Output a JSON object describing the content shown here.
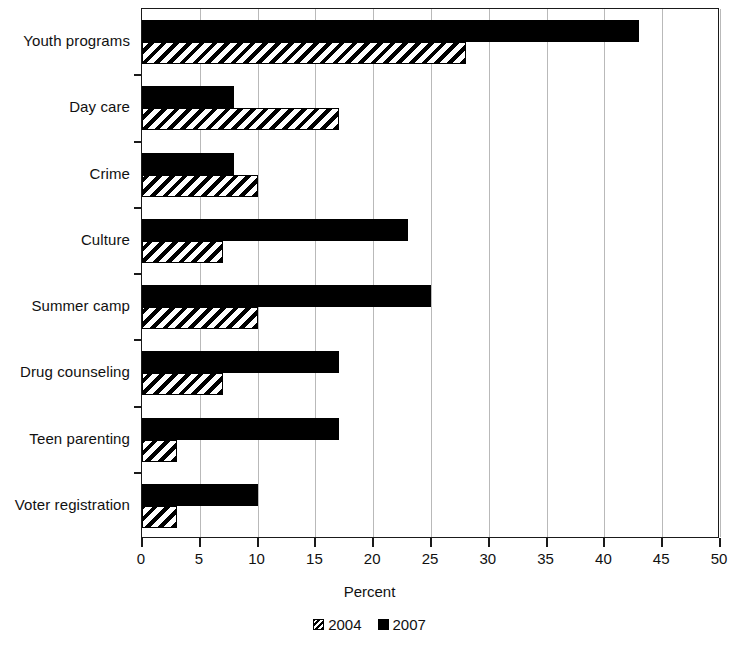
{
  "chart_data": {
    "type": "bar",
    "orientation": "horizontal",
    "title": "",
    "xlabel": "Percent",
    "ylabel": "",
    "xlim": [
      0,
      50
    ],
    "xticks": [
      0,
      5,
      10,
      15,
      20,
      25,
      30,
      35,
      40,
      45,
      50
    ],
    "xtick_labels": [
      "0",
      "5",
      "10",
      "15",
      "20",
      "25",
      "30",
      "35",
      "40",
      "45",
      "50"
    ],
    "grid": true,
    "grid_axis": "x",
    "legend_position": "bottom-center",
    "categories": [
      "Youth programs",
      "Day care",
      "Crime",
      "Culture",
      "Summer camp",
      "Drug counseling",
      "Teen parenting",
      "Voter registration"
    ],
    "series": [
      {
        "name": "2004",
        "pattern": "diagonal-hatch",
        "color": "#ffffff",
        "values": [
          28,
          17,
          10,
          7,
          10,
          7,
          3,
          3
        ]
      },
      {
        "name": "2007",
        "pattern": "solid",
        "color": "#000000",
        "values": [
          43,
          8,
          8,
          23,
          25,
          17,
          17,
          10
        ]
      }
    ]
  },
  "axis": {
    "x_title": "Percent"
  },
  "legend": {
    "items": [
      {
        "label": "2004",
        "swatch": "hatched-square-icon"
      },
      {
        "label": "2007",
        "swatch": "solid-square-icon"
      }
    ]
  }
}
